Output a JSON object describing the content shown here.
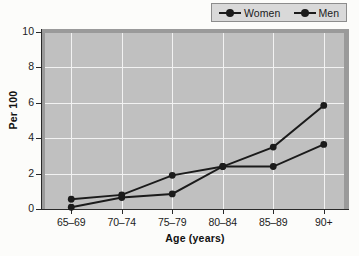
{
  "chart_data": {
    "type": "line",
    "title": "",
    "xlabel": "Age (years)",
    "ylabel": "Per 100",
    "categories": [
      "65–69",
      "70–74",
      "75–79",
      "80–84",
      "85–89",
      "90+"
    ],
    "series": [
      {
        "name": "Women",
        "values": [
          0.1,
          0.65,
          0.85,
          2.4,
          2.4,
          3.65
        ],
        "color": "#1b1b1b"
      },
      {
        "name": "Men",
        "values": [
          0.55,
          0.8,
          1.9,
          2.4,
          3.5,
          5.85
        ],
        "color": "#1b1b1b"
      }
    ],
    "ylim": [
      0,
      10
    ],
    "yticks": [
      0,
      2,
      4,
      6,
      8,
      10
    ],
    "ytick_labels": [
      "0",
      "2",
      "4",
      "6",
      "8",
      "10"
    ],
    "grid": "both",
    "legend_position": "top-right",
    "plot_background": "#c0c0c0",
    "gridline_color": "#f2f2f2",
    "axis_color": "#2a2a2a"
  },
  "legend": {
    "entries": [
      {
        "label": "Women",
        "symbol": "line-marker-icon"
      },
      {
        "label": "Men",
        "symbol": "line-marker-icon"
      }
    ]
  }
}
